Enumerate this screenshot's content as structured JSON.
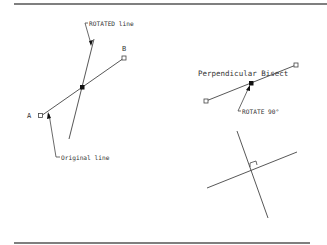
{
  "diagram": {
    "colors": {
      "line": "#444444",
      "text": "#333333",
      "background": "#ffffff"
    },
    "left_panel": {
      "point_a_label": "A",
      "point_b_label": "B",
      "rotated_callout": "ROTATED line",
      "original_callout": "Original line"
    },
    "right_panel": {
      "title": "Perpendicular Bisect",
      "rotate_callout": "ROTATE 90°"
    }
  }
}
